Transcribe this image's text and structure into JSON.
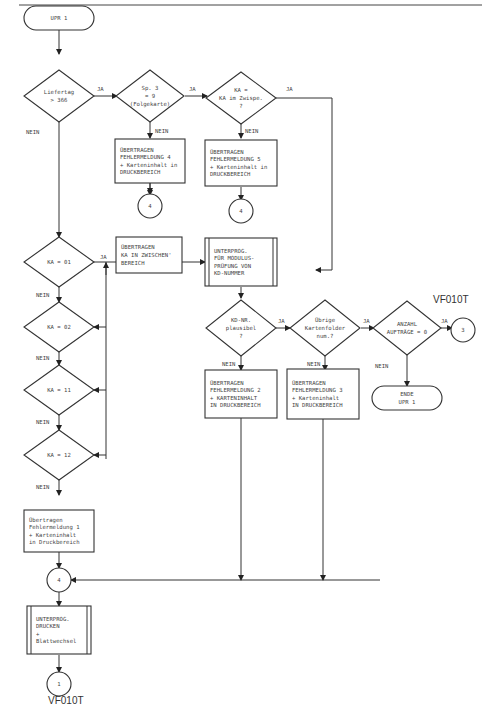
{
  "diagram": {
    "page_ref_top": "VF010T",
    "page_ref_bottom": "VF010T",
    "start": {
      "id": "start",
      "lines": [
        "UPR 1"
      ]
    },
    "nodes": {
      "d_liefertag": {
        "type": "decision",
        "lines": [
          "Liefertag",
          "> 366"
        ]
      },
      "d_sp3": {
        "type": "decision",
        "lines": [
          "Sp. 3",
          "= 9",
          "(Folgekarte)"
        ]
      },
      "d_ka_zwispe": {
        "type": "decision",
        "lines": [
          "KA =",
          "KA im Zwispe.",
          "?"
        ]
      },
      "p_fehler4": {
        "type": "process",
        "lines": [
          "ÜBERTRAGEN",
          "FEHLERMELDUNG 4",
          "+ Karteninhalt in",
          "DRUCKBEREICH"
        ]
      },
      "p_fehler5": {
        "type": "process",
        "lines": [
          "ÜBERTRAGEN",
          "FEHLERMELDUNG 5",
          "+ Karteninhalt in",
          "DRUCKBEREICH"
        ]
      },
      "c4_a": {
        "type": "connector",
        "lines": [
          "4"
        ]
      },
      "c4_b": {
        "type": "connector",
        "lines": [
          "4"
        ]
      },
      "d_ka01": {
        "type": "decision",
        "lines": [
          "KA = 01"
        ]
      },
      "d_ka02": {
        "type": "decision",
        "lines": [
          "KA = 02"
        ]
      },
      "d_ka11": {
        "type": "decision",
        "lines": [
          "KA = 11"
        ]
      },
      "d_ka12": {
        "type": "decision",
        "lines": [
          "KA = 12"
        ]
      },
      "p_zwischen": {
        "type": "process",
        "lines": [
          "ÜBERTRAGEN",
          "KA IN ZWISCHEN'",
          "BEREICH"
        ]
      },
      "s_modulus": {
        "type": "subroutine",
        "lines": [
          "UNTERPROG.",
          "FÜR MODULUS-",
          "PRÜFUNG VON",
          "KD-NUMMER"
        ]
      },
      "d_kdnr": {
        "type": "decision",
        "lines": [
          "KD-NR.",
          "plausibel",
          "?"
        ]
      },
      "d_kartenfolder": {
        "type": "decision",
        "lines": [
          "Übrige",
          "Kartenfolder",
          "num.?"
        ]
      },
      "d_anzahl": {
        "type": "decision",
        "lines": [
          "ANZAHL",
          "AUFTRÄGE = 0"
        ]
      },
      "c3": {
        "type": "connector",
        "lines": [
          "3"
        ]
      },
      "end": {
        "type": "terminal",
        "lines": [
          "ENDE",
          "UPR 1"
        ]
      },
      "p_fehler2": {
        "type": "process",
        "lines": [
          "ÜBERTRAGEN",
          "FEHLERMELDUNG 2",
          "+ KARTENINHALT",
          "IN DRUCKBEREICH"
        ]
      },
      "p_fehler3": {
        "type": "process",
        "lines": [
          "ÜBERTRAGEN",
          "FEHLERMELDUNG 3",
          "+ Karteninhalt",
          "IN DRUCKBEREICH"
        ]
      },
      "p_fehler1": {
        "type": "process",
        "lines": [
          "Übertragen",
          "Fehlermeldung 1",
          "+ Karteninhalt",
          "in Druckbereich"
        ]
      },
      "c4_main": {
        "type": "connector",
        "lines": [
          "4"
        ]
      },
      "s_drucken": {
        "type": "subroutine",
        "lines": [
          "UNTERPROG.",
          "DRUCKEN",
          "+",
          "Blattwechsel"
        ]
      },
      "c1": {
        "type": "connector",
        "lines": [
          "1"
        ]
      }
    },
    "edge_labels": {
      "yes": "JA",
      "no": "NEIN"
    }
  }
}
